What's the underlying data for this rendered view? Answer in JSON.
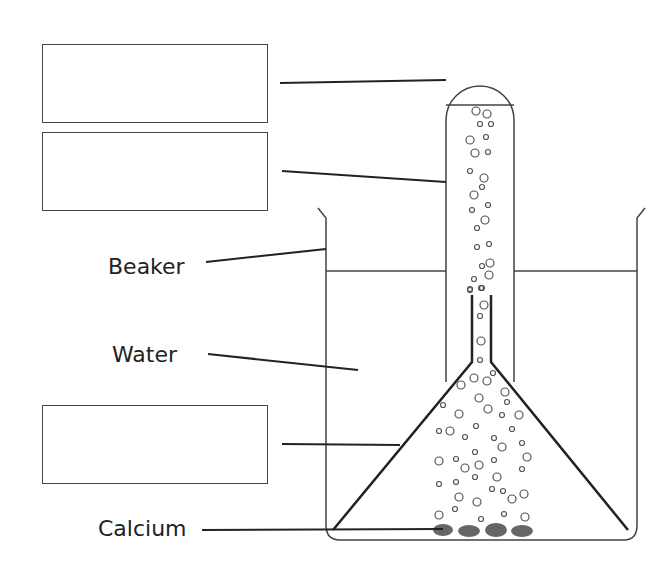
{
  "diagram": {
    "title": "",
    "labels": {
      "beaker": "Beaker",
      "water": "Water",
      "calcium": "Calcium"
    },
    "blank_boxes": [
      {
        "id": "box-1",
        "points_to": "gas at top of test tube",
        "text": ""
      },
      {
        "id": "box-2",
        "points_to": "test tube",
        "text": ""
      },
      {
        "id": "box-3",
        "points_to": "funnel",
        "text": ""
      }
    ],
    "components": [
      "beaker",
      "water",
      "inverted test tube",
      "inverted funnel",
      "gas bubbles",
      "calcium pieces"
    ],
    "colors": {
      "line": "#333333",
      "calcium": "#666666",
      "background": "#ffffff"
    }
  }
}
